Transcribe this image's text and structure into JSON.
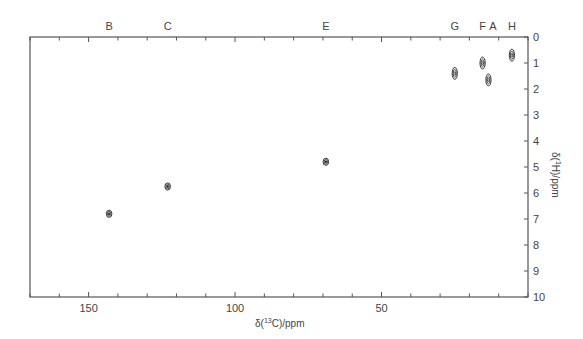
{
  "chart_data": {
    "type": "scatter",
    "title": "",
    "xlabel": "δ(13C)/ppm",
    "ylabel": "δ(1H)/ppm",
    "xlim": [
      170,
      0
    ],
    "ylim": [
      10,
      0
    ],
    "x_reversed": true,
    "y_reversed": true,
    "grid": false,
    "x_major_ticks": [
      150,
      100,
      50
    ],
    "x_minor_step": 10,
    "y_ticks": [
      0,
      1,
      2,
      3,
      4,
      5,
      6,
      7,
      8,
      9,
      10
    ],
    "y_axis_position": "right",
    "peak_label_position": "top",
    "series": [
      {
        "name": "cross peaks",
        "points": [
          {
            "label": "B",
            "x": 143,
            "y": 6.8
          },
          {
            "label": "C",
            "x": 123,
            "y": 5.75
          },
          {
            "label": "E",
            "x": 69,
            "y": 4.8
          },
          {
            "label": "G",
            "x": 25,
            "y": 1.4
          },
          {
            "label": "F",
            "x": 15.5,
            "y": 1.0
          },
          {
            "label": "A",
            "x": 13.5,
            "y": 1.65
          },
          {
            "label": "H",
            "x": 5.5,
            "y": 0.7
          }
        ]
      }
    ],
    "top_labels": [
      {
        "label": "B",
        "x": 143
      },
      {
        "label": "C",
        "x": 123
      },
      {
        "label": "E",
        "x": 69
      },
      {
        "label": "G",
        "x": 25
      },
      {
        "label": "F",
        "x": 15.5
      },
      {
        "label": "A",
        "x": 12
      },
      {
        "label": "H",
        "x": 5.5
      }
    ]
  },
  "axes": {
    "x_title_prefix": "δ(",
    "x_title_sup": "13",
    "x_title_suffix": "C)/ppm",
    "y_title_prefix": "δ(",
    "y_title_sup": "1",
    "y_title_suffix": "H)/ppm"
  },
  "colors": {
    "axis": "#555555",
    "peak": "#222222",
    "text": "#444444"
  }
}
